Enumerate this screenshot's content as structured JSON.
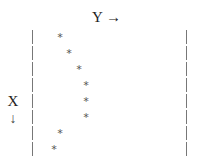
{
  "chart_data": {
    "type": "scatter",
    "title": "",
    "xlabel": "X",
    "ylabel": "Y",
    "x_axis_direction": "down",
    "y_axis_direction": "right",
    "marker": "*",
    "grid": false,
    "legend": null,
    "points": [
      {
        "row": 1,
        "col": 4
      },
      {
        "row": 2,
        "col": 5
      },
      {
        "row": 3,
        "col": 6
      },
      {
        "row": 4,
        "col": 7
      },
      {
        "row": 5,
        "col": 7
      },
      {
        "row": 6,
        "col": 7
      },
      {
        "row": 7,
        "col": 4
      },
      {
        "row": 8,
        "col": 3
      }
    ]
  },
  "labels": {
    "y_axis": "Y →",
    "x_axis": "X",
    "x_arrow": "↓"
  },
  "render": {
    "row_pixels": [
      36,
      52,
      68,
      84,
      100,
      116,
      132,
      148
    ],
    "col_pixels": [
      60,
      69,
      79,
      86,
      86,
      86,
      60,
      54
    ]
  }
}
